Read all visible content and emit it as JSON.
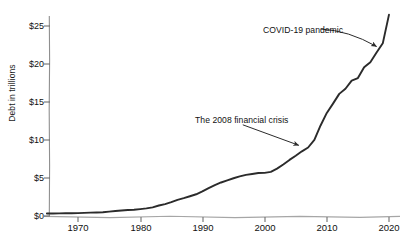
{
  "chart_data": {
    "type": "line",
    "title": "",
    "subtitle": "",
    "xlabel": "",
    "ylabel": "Debt in trillions",
    "xlim": [
      1965,
      2021
    ],
    "ylim": [
      0,
      27
    ],
    "grid": false,
    "legend": "none",
    "xticks": [
      "1970",
      "1980",
      "1990",
      "2000",
      "2010",
      "2020"
    ],
    "xtick_values": [
      1970,
      1980,
      1990,
      2000,
      2010,
      2020
    ],
    "yticks": [
      "$0",
      "$5",
      "$10",
      "$15",
      "$20",
      "$25"
    ],
    "ytick_values": [
      0,
      5,
      10,
      15,
      20,
      25
    ],
    "line_color": "#2b2b2b",
    "axis_color": "#8a8a8a",
    "series": [
      {
        "name": "U.S. national debt",
        "x": [
          1965,
          1966,
          1967,
          1968,
          1969,
          1970,
          1971,
          1972,
          1973,
          1974,
          1975,
          1976,
          1977,
          1978,
          1979,
          1980,
          1981,
          1982,
          1983,
          1984,
          1985,
          1986,
          1987,
          1988,
          1989,
          1990,
          1991,
          1992,
          1993,
          1994,
          1995,
          1996,
          1997,
          1998,
          1999,
          2000,
          2001,
          2002,
          2003,
          2004,
          2005,
          2006,
          2007,
          2008,
          2009,
          2010,
          2011,
          2012,
          2013,
          2014,
          2015,
          2016,
          2017,
          2018,
          2019,
          2020
        ],
        "y": [
          0.32,
          0.33,
          0.34,
          0.36,
          0.37,
          0.38,
          0.41,
          0.44,
          0.47,
          0.49,
          0.58,
          0.65,
          0.72,
          0.78,
          0.83,
          0.91,
          1.0,
          1.14,
          1.38,
          1.57,
          1.82,
          2.13,
          2.35,
          2.6,
          2.86,
          3.23,
          3.67,
          4.06,
          4.41,
          4.69,
          4.97,
          5.22,
          5.41,
          5.53,
          5.66,
          5.67,
          5.81,
          6.23,
          6.78,
          7.38,
          7.93,
          8.51,
          9.01,
          10.02,
          11.91,
          13.56,
          14.79,
          16.07,
          16.74,
          17.82,
          18.15,
          19.57,
          20.24,
          21.52,
          22.72,
          26.5
        ],
        "units": "trillions of dollars"
      }
    ],
    "annotations": [
      {
        "text": "The 2008 financial crisis",
        "text_x": 1992.0,
        "text_y": 13.0,
        "arrow_from_x": 1996.5,
        "arrow_from_y": 12.0,
        "arrow_to_x": 2005.5,
        "arrow_to_y": 9.3
      },
      {
        "text": "COVID-19 pandemic",
        "text_x": 2004.0,
        "text_y": 25.6,
        "arrow_from_x": 2009.0,
        "arrow_from_y": 24.6,
        "arrow_to_x": 2018.0,
        "arrow_to_y": 22.3
      }
    ]
  }
}
